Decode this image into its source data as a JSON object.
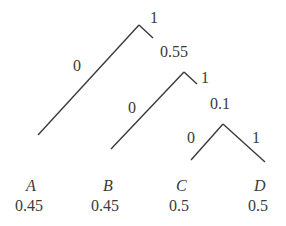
{
  "diagram": {
    "type": "binary-code-tree",
    "nodes": [
      {
        "id": "n1",
        "edge_labels": {
          "left": "0",
          "right": "1"
        },
        "value": ""
      },
      {
        "id": "n2",
        "edge_labels": {
          "left": "0",
          "right": "1"
        },
        "value": "0.55"
      },
      {
        "id": "n3",
        "edge_labels": {
          "left": "0",
          "right": "1"
        },
        "value": "0.1"
      }
    ],
    "leaves": [
      {
        "symbol": "A",
        "value": "0.45"
      },
      {
        "symbol": "B",
        "value": "0.45"
      },
      {
        "symbol": "C",
        "value": "0.5"
      },
      {
        "symbol": "D",
        "value": "0.5"
      }
    ],
    "line_color": "#3a3a3a"
  }
}
